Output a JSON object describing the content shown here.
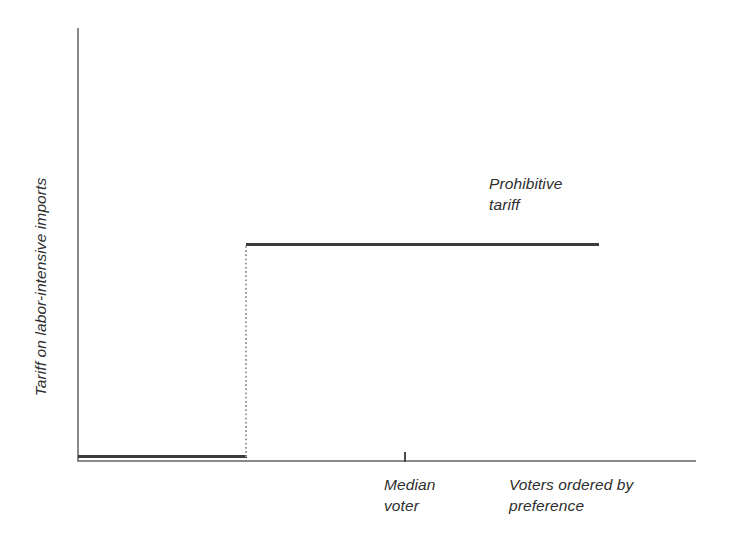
{
  "chart_data": {
    "type": "line",
    "title": "",
    "subtitle": "",
    "xlabel": "Voters ordered by\npreference",
    "ylabel": "Tariff on labor-intensive imports",
    "grid": false,
    "legend": "none",
    "xlim": [
      0,
      100
    ],
    "ylim": [
      0,
      100
    ],
    "x_axis_ticks": [
      {
        "label": "Median\nvoter",
        "position_pct": 53
      }
    ],
    "annotations": [
      {
        "text": "Prohibitive\ntariff",
        "position_pct": [
          67,
          74
        ]
      }
    ],
    "series": [
      {
        "name": "Tariff schedule by voter preference",
        "style": "step",
        "x": [
          0,
          27,
          27,
          84
        ],
        "values": [
          2,
          2,
          50,
          50
        ],
        "segments": [
          {
            "name": "low-tariff-segment",
            "x_start_pct": 0,
            "x_end_pct": 27,
            "y_pct": 2
          },
          {
            "name": "riser-dotted",
            "x_pct": 27,
            "y_start_pct": 2,
            "y_end_pct": 50
          },
          {
            "name": "prohibitive-tariff-segment",
            "x_start_pct": 27,
            "x_end_pct": 84,
            "y_pct": 50
          }
        ]
      }
    ],
    "colors": {
      "line": "#3b3b3b",
      "axis": "#8a8a8a",
      "riser": "#9a9a9a",
      "text": "#2e2e2e",
      "background": "#ffffff"
    }
  },
  "axes": {
    "y_label": "Tariff on labor-intensive imports",
    "x_tick_label": "Median\nvoter",
    "x_axis_caption": "Voters ordered by\npreference"
  },
  "annotations": {
    "prohibitive_tariff": "Prohibitive\ntariff"
  }
}
